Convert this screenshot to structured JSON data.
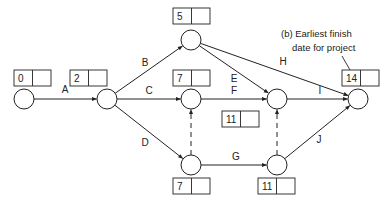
{
  "diagram": {
    "type": "activity-on-arrow network",
    "nodes": [
      {
        "id": "n1",
        "x": 24,
        "y": 99,
        "earliest": "0",
        "latest": "",
        "box": {
          "x": 14,
          "y": 70
        }
      },
      {
        "id": "n2",
        "x": 107,
        "y": 99,
        "earliest": "2",
        "latest": "",
        "box": {
          "x": 70,
          "y": 70
        }
      },
      {
        "id": "n3",
        "x": 191,
        "y": 40,
        "earliest": "5",
        "latest": "",
        "box": {
          "x": 173,
          "y": 8
        }
      },
      {
        "id": "n4",
        "x": 191,
        "y": 99,
        "earliest": "7",
        "latest": "",
        "box": {
          "x": 173,
          "y": 70
        }
      },
      {
        "id": "n5",
        "x": 277,
        "y": 99,
        "earliest": "11",
        "latest": "",
        "box": {
          "x": 222,
          "y": 111
        }
      },
      {
        "id": "n6",
        "x": 358,
        "y": 99,
        "earliest": "14",
        "latest": "",
        "box": {
          "x": 342,
          "y": 70
        }
      },
      {
        "id": "n7",
        "x": 191,
        "y": 165,
        "earliest": "7",
        "latest": "",
        "box": {
          "x": 173,
          "y": 178
        }
      },
      {
        "id": "n8",
        "x": 277,
        "y": 165,
        "earliest": "11",
        "latest": "",
        "box": {
          "x": 258,
          "y": 178
        }
      }
    ],
    "activities": [
      {
        "label": "A",
        "from": "n1",
        "to": "n2",
        "dummy": false
      },
      {
        "label": "B",
        "from": "n2",
        "to": "n3",
        "dummy": false
      },
      {
        "label": "C",
        "from": "n2",
        "to": "n4",
        "dummy": false
      },
      {
        "label": "D",
        "from": "n2",
        "to": "n7",
        "dummy": false
      },
      {
        "label": "E",
        "from": "n3",
        "to": "n5",
        "dummy": false
      },
      {
        "label": "F",
        "from": "n4",
        "to": "n5",
        "dummy": false
      },
      {
        "label": "G",
        "from": "n7",
        "to": "n8",
        "dummy": false
      },
      {
        "label": "H",
        "from": "n3",
        "to": "n6",
        "dummy": false
      },
      {
        "label": "I",
        "from": "n5",
        "to": "n6",
        "dummy": false
      },
      {
        "label": "J",
        "from": "n8",
        "to": "n6",
        "dummy": false
      },
      {
        "label": "",
        "from": "n7",
        "to": "n4",
        "dummy": true
      },
      {
        "label": "",
        "from": "n8",
        "to": "n5",
        "dummy": true
      }
    ],
    "annotation": {
      "line1": "(b)  Earliest finish",
      "line2": "date for project"
    }
  }
}
